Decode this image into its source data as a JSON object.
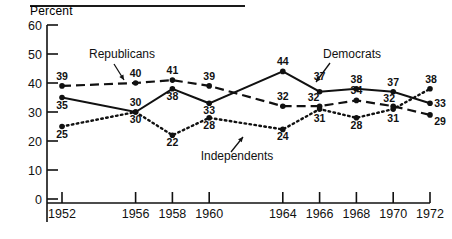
{
  "chart_data": {
    "type": "line",
    "title": "",
    "xlabel": "",
    "ylabel": "Percent",
    "ylim": [
      0,
      60
    ],
    "xlim": [
      1951,
      1973
    ],
    "yticks": [
      0,
      10,
      20,
      30,
      40,
      50,
      60
    ],
    "ytick_labels": [
      "0",
      "10",
      "20",
      "30",
      "40",
      "50",
      "60"
    ],
    "x": [
      1952,
      1956,
      1958,
      1960,
      1964,
      1966,
      1968,
      1970,
      1972
    ],
    "xtick_labels": [
      "1952",
      "1956",
      "1958",
      "1960",
      "1964",
      "1966",
      "1968",
      "1970",
      "1972"
    ],
    "grid": false,
    "legend": "inline-annotations",
    "series": [
      {
        "name": "Republicans",
        "style": "dashed",
        "marker": "filled-circle",
        "values": [
          39,
          40,
          41,
          39,
          32,
          32,
          34,
          32,
          29
        ],
        "label_positions": [
          "above",
          "above",
          "above",
          "above",
          "above",
          "above",
          "above",
          "above",
          "below"
        ]
      },
      {
        "name": "Democrats",
        "style": "solid",
        "marker": "filled-circle",
        "values": [
          35,
          30,
          38,
          33,
          44,
          37,
          38,
          37,
          33
        ],
        "label_positions": [
          "below",
          "above",
          "below",
          "below",
          "above",
          "above",
          "above",
          "above",
          "below"
        ]
      },
      {
        "name": "Independents",
        "style": "dotted",
        "marker": "filled-circle",
        "values": [
          25,
          30,
          22,
          28,
          24,
          31,
          28,
          31,
          38
        ],
        "label_positions": [
          "below",
          "below",
          "below",
          "below",
          "below",
          "below",
          "below",
          "below",
          "above"
        ]
      }
    ],
    "annotations": [
      {
        "text": "Republicans",
        "target_series": "Republicans",
        "target_x": 1955
      },
      {
        "text": "Democrats",
        "target_series": "Democrats",
        "target_x": 1966
      },
      {
        "text": "Independents",
        "target_series": "Independents",
        "target_x": 1964
      }
    ]
  }
}
